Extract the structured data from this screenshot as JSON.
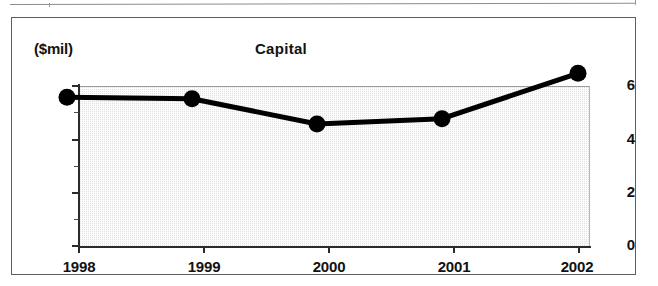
{
  "figure": {
    "units_label": "($mil)",
    "title": "Capital"
  },
  "axes": {
    "y_tick_labels": [
      "0",
      "2",
      "4",
      "6"
    ],
    "y_minor_values": [
      1,
      3,
      5
    ],
    "x_tick_labels": [
      "1998",
      "1999",
      "2000",
      "2001",
      "2002"
    ]
  },
  "colors": {
    "line": "#000000",
    "marker": "#000000",
    "plot_fill": "#e2e2e2",
    "frame": "#5e5e5e",
    "axis": "#2b2b2b",
    "text": "#121212"
  },
  "chart_data": {
    "type": "line",
    "title": "Capital",
    "subtitle": "",
    "xlabel": "",
    "ylabel": "($mil)",
    "categories": [
      "1998",
      "1999",
      "2000",
      "2001",
      "2002"
    ],
    "x": [
      1998,
      1999,
      2000,
      2001,
      2002
    ],
    "values": [
      4.9,
      4.85,
      3.9,
      4.1,
      5.8
    ],
    "series": [
      {
        "name": "Capital",
        "values": [
          4.9,
          4.85,
          3.9,
          4.1,
          5.8
        ]
      }
    ],
    "ylim": [
      0,
      6
    ],
    "xlim": [
      "1998",
      "2002"
    ],
    "y_ticks": [
      0,
      2,
      4,
      6
    ],
    "y_minor_ticks": [
      1,
      3,
      5
    ],
    "grid": false,
    "legend": "none",
    "markers": "filled-circle",
    "units": "$ millions"
  }
}
